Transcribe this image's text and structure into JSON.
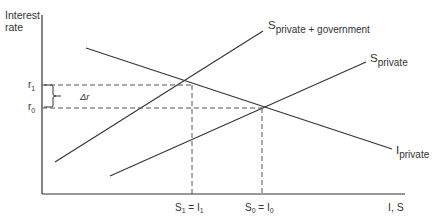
{
  "diagram": {
    "y_axis_label_line1": "Interest",
    "y_axis_label_line2": "rate",
    "x_axis_label": "I, S",
    "r1_label": "r",
    "r1_sub": "1",
    "r0_label": "r",
    "r0_sub": "0",
    "delta_r_label": "Δr",
    "curves": {
      "s_private_gov": {
        "main": "S",
        "sub": "private + government"
      },
      "s_private": {
        "main": "S",
        "sub": "private"
      },
      "i_private": {
        "main": "I",
        "sub": "private"
      }
    },
    "x_ticks": {
      "s1": {
        "a": "S",
        "a_sub": "1",
        "eq": " = ",
        "b": "I",
        "b_sub": "1"
      },
      "s0": {
        "a": "S",
        "a_sub": "0",
        "eq": " = ",
        "b": "I",
        "b_sub": "0"
      }
    },
    "colors": {
      "line": "#333333",
      "dash": "#555555"
    }
  }
}
